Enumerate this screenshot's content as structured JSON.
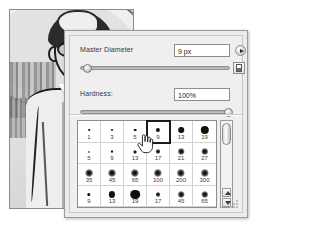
{
  "panel": {
    "title": "Brush Preset Picker",
    "master_diameter": {
      "label": "Master Diameter",
      "value": "9 px",
      "slider_percent": 4
    },
    "hardness": {
      "label": "Hardness:",
      "value": "100%",
      "slider_percent": 100
    },
    "buttons": {
      "menu_icon": "panel-menu-triangle-icon",
      "preset_manager_icon": "brush-preset-icon"
    },
    "scrollbar": {
      "up_arrow_icon": "scroll-up-arrow-icon",
      "down_arrow_icon": "scroll-down-arrow-icon",
      "thumb_position_percent": 2
    },
    "resize_grip_icon": "resize-grip-icon"
  },
  "brush_grid": {
    "selected_index": 3,
    "cells": [
      {
        "size": "1",
        "dot": 1.5,
        "type": "hard"
      },
      {
        "size": "3",
        "dot": 2.0,
        "type": "hard"
      },
      {
        "size": "5",
        "dot": 2.6,
        "type": "hard"
      },
      {
        "size": "9",
        "dot": 4.2,
        "type": "hard"
      },
      {
        "size": "13",
        "dot": 5.6,
        "type": "hard"
      },
      {
        "size": "19",
        "dot": 8.4,
        "type": "hard"
      },
      {
        "size": "5",
        "dot": 2.0,
        "type": "soft"
      },
      {
        "size": "9",
        "dot": 3.0,
        "type": "soft"
      },
      {
        "size": "13",
        "dot": 4.0,
        "type": "soft"
      },
      {
        "size": "17",
        "dot": 5.0,
        "type": "soft"
      },
      {
        "size": "21",
        "dot": 6.6,
        "type": "soft"
      },
      {
        "size": "27",
        "dot": 7.4,
        "type": "soft"
      },
      {
        "size": "35",
        "dot": 7.8,
        "type": "soft"
      },
      {
        "size": "45",
        "dot": 8.0,
        "type": "soft"
      },
      {
        "size": "65",
        "dot": 8.4,
        "type": "soft"
      },
      {
        "size": "100",
        "dot": 8.4,
        "type": "soft"
      },
      {
        "size": "200",
        "dot": 8.4,
        "type": "soft"
      },
      {
        "size": "300",
        "dot": 8.4,
        "type": "soft"
      },
      {
        "size": "9",
        "dot": 3.4,
        "type": "hard"
      },
      {
        "size": "13",
        "dot": 6.2,
        "type": "hard"
      },
      {
        "size": "19",
        "dot": 9.6,
        "type": "hard"
      },
      {
        "size": "17",
        "dot": 5.0,
        "type": "soft"
      },
      {
        "size": "45",
        "dot": 6.6,
        "type": "soft"
      },
      {
        "size": "65",
        "dot": 7.4,
        "type": "soft"
      }
    ]
  },
  "cursor": {
    "icon": "pointing-hand-cursor"
  },
  "illustration": {
    "name": "cartoon-man-with-glasses-illustration"
  },
  "colors": {
    "panel_bg": "#ececec",
    "panel_border": "#9a9a9a",
    "grid_bg": "#ffffff",
    "selection_border": "#1b1b1b",
    "text": "#3a3a3a"
  }
}
